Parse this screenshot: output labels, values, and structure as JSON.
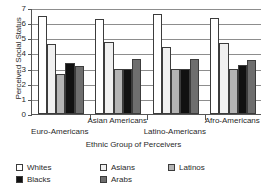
{
  "chart_data": {
    "type": "bar",
    "title": "",
    "xlabel": "Ethnic Group of Perceivers",
    "ylabel": "Perceived Social Status",
    "ylim": [
      0,
      7
    ],
    "yticks": [
      0,
      1,
      2,
      3,
      4,
      5,
      6,
      7
    ],
    "grid": true,
    "legend_position": "bottom",
    "categories": [
      "Euro-Americans",
      "Asian Americans",
      "Latino-Americans",
      "Afro-Americans"
    ],
    "series": [
      {
        "name": "Whites",
        "color": "#ffffff",
        "values": [
          6.45,
          6.3,
          6.6,
          6.35
        ]
      },
      {
        "name": "Asians",
        "color": "#f0f0f0",
        "values": [
          4.6,
          4.75,
          4.45,
          4.7
        ]
      },
      {
        "name": "Latinos",
        "color": "#b4b4b4",
        "values": [
          2.65,
          3.0,
          3.0,
          3.0
        ]
      },
      {
        "name": "Blacks",
        "color": "#111111",
        "values": [
          3.4,
          2.95,
          3.0,
          3.25
        ]
      },
      {
        "name": "Arabs",
        "color": "#6e6e6e",
        "values": [
          3.2,
          3.65,
          3.65,
          3.55
        ]
      }
    ]
  },
  "axes": {
    "y_title": "Perceived Social Status",
    "x_title": "Ethnic Group of Perceivers",
    "y_tick_labels": [
      "7",
      "6",
      "5",
      "4",
      "3",
      "2",
      "1",
      "0"
    ]
  },
  "x_tick_labels": [
    {
      "text": "Euro-Americans",
      "row": 1
    },
    {
      "text": "Asian Americans",
      "row": 0
    },
    {
      "text": "Latino-Americans",
      "row": 1
    },
    {
      "text": "Afro-Americans",
      "row": 0
    }
  ],
  "legend": {
    "items": [
      {
        "label": "Whites",
        "color": "#ffffff",
        "col": 0,
        "row": 0
      },
      {
        "label": "Blacks",
        "color": "#111111",
        "col": 0,
        "row": 1
      },
      {
        "label": "Asians",
        "color": "#f0f0f0",
        "col": 1,
        "row": 0
      },
      {
        "label": "Arabs",
        "color": "#6e6e6e",
        "col": 1,
        "row": 1
      },
      {
        "label": "Latinos",
        "color": "#b4b4b4",
        "col": 2,
        "row": 0
      }
    ]
  }
}
